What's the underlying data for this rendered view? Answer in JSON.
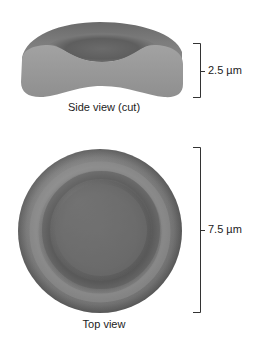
{
  "figure": {
    "side_view": {
      "caption": "Side view (cut)",
      "dimension_label": "2.5 µm"
    },
    "top_view": {
      "caption": "Top view",
      "dimension_label": "7.5 µm"
    },
    "colors": {
      "cell_dark": "#5a5a5a",
      "cell_mid": "#7a7a7a",
      "cell_light": "#9a9a9a",
      "cut_surface": "#999999",
      "bracket": "#333333",
      "background": "#ffffff"
    }
  }
}
